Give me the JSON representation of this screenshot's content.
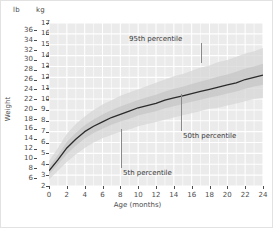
{
  "chart_data": {
    "type": "line",
    "title": "",
    "subtitle": "",
    "xlabel": "Age (months)",
    "ylabel": "Weight",
    "xlim": [
      0,
      24
    ],
    "ylim_kg": [
      2,
      17
    ],
    "ylim_lb": [
      4.4,
      37.5
    ],
    "grid": true,
    "legend": "none",
    "x_unit": "months",
    "y_unit_primary": "lb",
    "y_unit_secondary": "kg",
    "x_ticks": [
      0,
      2,
      4,
      6,
      8,
      10,
      12,
      14,
      16,
      18,
      20,
      22,
      24
    ],
    "y_ticks_lb": [
      6,
      8,
      10,
      12,
      14,
      16,
      18,
      20,
      22,
      24,
      26,
      28,
      30,
      32,
      34,
      36
    ],
    "y_ticks_kg": [
      2,
      3,
      4,
      5,
      6,
      7,
      8,
      9,
      10,
      11,
      12,
      13,
      14,
      15,
      16,
      17
    ],
    "unit_header_left": "lb",
    "unit_header_right": "kg",
    "x": [
      0,
      1,
      2,
      3,
      4,
      5,
      6,
      7,
      8,
      9,
      10,
      11,
      12,
      13,
      14,
      15,
      16,
      17,
      18,
      19,
      20,
      21,
      22,
      23,
      24
    ],
    "series": [
      {
        "name": "5th percentile",
        "unit": "kg",
        "values": [
          2.6,
          3.4,
          4.2,
          4.9,
          5.5,
          6.0,
          6.4,
          6.7,
          7.0,
          7.2,
          7.5,
          7.7,
          7.9,
          8.1,
          8.3,
          8.5,
          8.7,
          8.9,
          9.1,
          9.2,
          9.4,
          9.6,
          9.8,
          10.0,
          10.1
        ]
      },
      {
        "name": "50th percentile",
        "unit": "kg",
        "values": [
          3.4,
          4.4,
          5.5,
          6.3,
          7.0,
          7.5,
          7.9,
          8.3,
          8.6,
          8.9,
          9.2,
          9.4,
          9.6,
          9.9,
          10.1,
          10.3,
          10.5,
          10.7,
          10.9,
          11.1,
          11.3,
          11.5,
          11.8,
          12.0,
          12.2
        ]
      },
      {
        "name": "95th percentile",
        "unit": "kg",
        "values": [
          4.3,
          5.5,
          6.8,
          7.7,
          8.4,
          9.0,
          9.5,
          9.9,
          10.3,
          10.6,
          10.9,
          11.2,
          11.5,
          11.8,
          12.1,
          12.3,
          12.6,
          12.9,
          13.1,
          13.4,
          13.6,
          13.9,
          14.2,
          14.4,
          14.7
        ]
      }
    ],
    "annotations": [
      {
        "label": "95th percentile",
        "x": 14,
        "y_kg": 15.1
      },
      {
        "label": "50th percentile",
        "x": 14.1,
        "y_kg": 6.6
      },
      {
        "label": "5th percentile",
        "x": 9.1,
        "y_kg": 3.5
      }
    ],
    "colors": {
      "plot_background": "#ebebeb",
      "gridline": "#ffffff",
      "curve": "#2b2b2b",
      "band_outer": "#d5d5d5",
      "band_inner": "#c2c2c2",
      "text": "#4d4d4d",
      "leader": "#8a8a8a",
      "page_background": "#ffffff",
      "frame": "#e2e2e2"
    }
  }
}
